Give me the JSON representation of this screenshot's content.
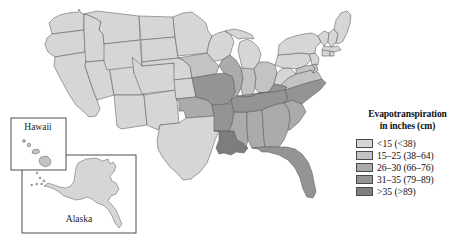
{
  "figure": {
    "type": "choropleth-map"
  },
  "insets": [
    {
      "id": "hawaii",
      "label": "Hawaii"
    },
    {
      "id": "alaska",
      "label": "Alaska"
    }
  ],
  "legend": {
    "title_line1": "Evapotranspiration",
    "title_line2": "in inches (cm)",
    "entries": [
      {
        "label": "<15 (<38)",
        "color": "#d6d6d6",
        "inches_min": null,
        "inches_max": 15,
        "cm_min": null,
        "cm_max": 38
      },
      {
        "label": "15–25 (38–64)",
        "color": "#c3c3c3",
        "inches_min": 15,
        "inches_max": 25,
        "cm_min": 38,
        "cm_max": 64
      },
      {
        "label": "26–30 (66–76)",
        "color": "#ababab",
        "inches_min": 26,
        "inches_max": 30,
        "cm_min": 66,
        "cm_max": 76
      },
      {
        "label": "31–35 (79–89)",
        "color": "#949494",
        "inches_min": 31,
        "inches_max": 35,
        "cm_min": 79,
        "cm_max": 89
      },
      {
        "label": ">35 (>89)",
        "color": "#7d7d7d",
        "inches_min": 35,
        "inches_max": null,
        "cm_min": 89,
        "cm_max": null
      }
    ]
  },
  "map_data": {
    "type": "choropleth",
    "value_field": "evapotranspiration_class",
    "classes": [
      "<15 (<38)",
      "15–25 (38–64)",
      "26–30 (66–76)",
      "31–35 (79–89)",
      ">35 (>89)"
    ],
    "states": [
      {
        "code": "WA",
        "class": 1
      },
      {
        "code": "OR",
        "class": 1
      },
      {
        "code": "CA",
        "class": 1
      },
      {
        "code": "ID",
        "class": 1
      },
      {
        "code": "NV",
        "class": 1
      },
      {
        "code": "UT",
        "class": 1
      },
      {
        "code": "AZ",
        "class": 1
      },
      {
        "code": "MT",
        "class": 1
      },
      {
        "code": "WY",
        "class": 1
      },
      {
        "code": "CO",
        "class": 1
      },
      {
        "code": "NM",
        "class": 1
      },
      {
        "code": "ND",
        "class": 1
      },
      {
        "code": "SD",
        "class": 1
      },
      {
        "code": "NE",
        "class": 1
      },
      {
        "code": "KS",
        "class": 1
      },
      {
        "code": "TX",
        "class": 1
      },
      {
        "code": "MN",
        "class": 1
      },
      {
        "code": "WI",
        "class": 1
      },
      {
        "code": "MI",
        "class": 1
      },
      {
        "code": "ME",
        "class": 1
      },
      {
        "code": "NH",
        "class": 1
      },
      {
        "code": "VT",
        "class": 1
      },
      {
        "code": "NY",
        "class": 1
      },
      {
        "code": "PA",
        "class": 1
      },
      {
        "code": "MA",
        "class": 1
      },
      {
        "code": "CT",
        "class": 1
      },
      {
        "code": "RI",
        "class": 1
      },
      {
        "code": "NJ",
        "class": 1
      },
      {
        "code": "WV",
        "class": 1
      },
      {
        "code": "OH",
        "class": 2
      },
      {
        "code": "IN",
        "class": 2
      },
      {
        "code": "IL",
        "class": 3
      },
      {
        "code": "IA",
        "class": 2
      },
      {
        "code": "MO",
        "class": 4
      },
      {
        "code": "OK",
        "class": 3
      },
      {
        "code": "AR",
        "class": 4
      },
      {
        "code": "LA",
        "class": 5
      },
      {
        "code": "MS",
        "class": 3
      },
      {
        "code": "AL",
        "class": 3
      },
      {
        "code": "TN",
        "class": 4
      },
      {
        "code": "KY",
        "class": 4
      },
      {
        "code": "GA",
        "class": 3
      },
      {
        "code": "FL",
        "class": 4
      },
      {
        "code": "SC",
        "class": 3
      },
      {
        "code": "NC",
        "class": 4
      },
      {
        "code": "VA",
        "class": 2
      },
      {
        "code": "MD",
        "class": 2
      },
      {
        "code": "DE",
        "class": 2
      },
      {
        "code": "AK",
        "class": 1
      },
      {
        "code": "HI",
        "class": 2
      }
    ]
  }
}
